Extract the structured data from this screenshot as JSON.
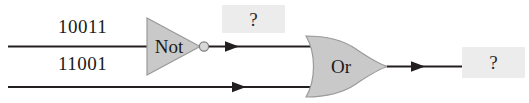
{
  "diagram": {
    "background_color": "#ffffff",
    "wire_color": "#231f20",
    "gate_fill_color": "#c9c9c9",
    "gate_stroke_color": "#8a8a8a",
    "placeholder_fill_color": "#ececec",
    "text_color": "#1a1a1a"
  },
  "inputs": [
    {
      "name": "input-top",
      "label": "10011"
    },
    {
      "name": "input-bottom",
      "label": "11001"
    }
  ],
  "gates": [
    {
      "name": "not-gate",
      "label": "Not",
      "type": "not"
    },
    {
      "name": "or-gate",
      "label": "Or",
      "type": "or"
    }
  ],
  "placeholders": [
    {
      "name": "not-output-placeholder",
      "label": "?"
    },
    {
      "name": "or-output-placeholder",
      "label": "?"
    }
  ]
}
